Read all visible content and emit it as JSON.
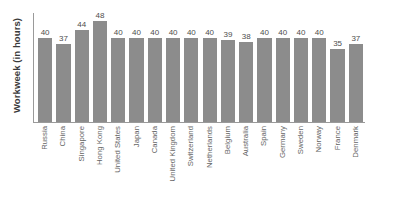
{
  "chart_data": {
    "type": "bar",
    "title": "",
    "subtitle": "",
    "xlabel": "",
    "ylabel": "Workweek (in hours)",
    "ylim": [
      0,
      52
    ],
    "grid": false,
    "legend": false,
    "legend_position": "none",
    "orientation": "vertical",
    "bar_color": "#8c8c8c",
    "axis_color": "#9a9a9a",
    "label_color": "#666666",
    "value_label_color": "#4d4d4d",
    "background_color": "#ffffff",
    "value_labels_shown": true,
    "categories": [
      "Russia",
      "China",
      "Singapore",
      "Hong Kong",
      "United States",
      "Japan",
      "Canada",
      "United Kingdom",
      "Switzerland",
      "Netherlands",
      "Belgium",
      "Australia",
      "Spain",
      "Germany",
      "Sweden",
      "Norway",
      "France",
      "Denmark"
    ],
    "values": [
      40,
      37,
      44,
      48,
      40,
      40,
      40,
      40,
      40,
      40,
      39,
      38,
      40,
      40,
      40,
      40,
      35,
      37
    ]
  }
}
